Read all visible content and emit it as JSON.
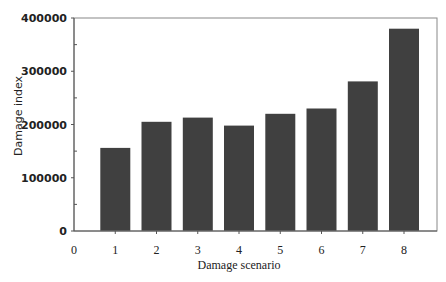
{
  "chart_data": {
    "type": "bar",
    "title": "",
    "xlabel": "Damage scenario",
    "ylabel": "Damage index",
    "categories": [
      "1",
      "2",
      "3",
      "4",
      "5",
      "6",
      "7",
      "8"
    ],
    "values": [
      156000,
      205000,
      213000,
      198000,
      220000,
      230000,
      281000,
      380000
    ],
    "ylim": [
      0,
      400000
    ],
    "xlim": [
      0,
      8.8
    ],
    "yticks": [
      0,
      100000,
      200000,
      300000,
      400000
    ],
    "ytick_labels": [
      "0",
      "100000",
      "200000",
      "300000",
      "400000"
    ],
    "y_minor_tick_step": 50000,
    "xticks": [
      0,
      1,
      2,
      3,
      4,
      5,
      6,
      7,
      8
    ],
    "xtick_labels": [
      "0",
      "1",
      "2",
      "3",
      "4",
      "5",
      "6",
      "7",
      "8"
    ],
    "grid": false,
    "legend": null,
    "bar_color": "#404040"
  }
}
